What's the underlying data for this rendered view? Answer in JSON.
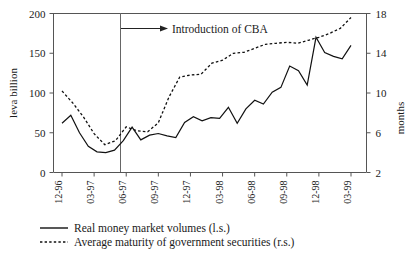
{
  "chart_data": {
    "type": "line",
    "title": "",
    "xlabel": "",
    "ylabel": "leva billion",
    "y2label": "months",
    "categories": [
      "12-96",
      "01-97",
      "02-97",
      "03-97",
      "04-97",
      "05-97",
      "06-97",
      "07-97",
      "08-97",
      "09-97",
      "10-97",
      "11-97",
      "12-97",
      "01-98",
      "02-98",
      "03-98",
      "04-98",
      "05-98",
      "06-98",
      "07-98",
      "08-98",
      "09-98",
      "10-98",
      "11-98",
      "12-98",
      "01-99",
      "02-99",
      "03-99"
    ],
    "tick_labels": [
      "12-96",
      "03-97",
      "06-97",
      "09-97",
      "12-97",
      "03-98",
      "06-98",
      "09-98",
      "12-98",
      "03-99"
    ],
    "ylim": [
      0,
      200
    ],
    "yticks": [
      0,
      50,
      100,
      150,
      200
    ],
    "y2lim": [
      2,
      18
    ],
    "y2ticks": [
      2,
      6,
      10,
      14,
      18
    ],
    "grid": false,
    "legend_position": "bottom-left",
    "series": [
      {
        "name": "Real money market volumes (l.s.)",
        "axis": "left",
        "style": "solid",
        "color": "#111111",
        "values": [
          62,
          70,
          52,
          38,
          30,
          26,
          28,
          26,
          28,
          32,
          36,
          38,
          42,
          40,
          38,
          39,
          38,
          42,
          40,
          38,
          42,
          46,
          43,
          41,
          43,
          47,
          45,
          47
        ]
      },
      {
        "name": "Average maturity of government securities (r.s.)",
        "axis": "right",
        "style": "dotted",
        "color": "#111111",
        "values": [
          10.4,
          9.2,
          8.0,
          6.6,
          5.6,
          5.4,
          6.0,
          7.1,
          8.6,
          10.5,
          11.7,
          11.8,
          12.0,
          12.6,
          13.0,
          13.7,
          14.0,
          14.2,
          14.4,
          14.6,
          14.7,
          14.9,
          15.1,
          15.3,
          15.7,
          16.2,
          16.9,
          17.6
        ]
      }
    ],
    "left_series_detailed": [
      62,
      70,
      52,
      38,
      30,
      26,
      24,
      26,
      28,
      31,
      33,
      34,
      57,
      40,
      47,
      49,
      46,
      44,
      63,
      70,
      65,
      69,
      69,
      82,
      62,
      80,
      91,
      86,
      101,
      107,
      134,
      128,
      110,
      170,
      151,
      146,
      143,
      160
    ],
    "annotation": {
      "text": "Introduction of CBA",
      "marker_tick": "06-97"
    },
    "legend": [
      {
        "label": "Real money market volumes (l.s.)",
        "style": "solid"
      },
      {
        "label": "Average maturity of government securities (r.s.)",
        "style": "dotted"
      }
    ],
    "solid_points": [
      {
        "x": "12-96",
        "y": 62
      },
      {
        "x": "01-97",
        "y": 72
      },
      {
        "x": "02-97",
        "y": 50
      },
      {
        "x": "03-97",
        "y": 33
      },
      {
        "x": "04-97",
        "y": 26
      },
      {
        "x": "05-97",
        "y": 25
      },
      {
        "x": "06-97",
        "y": 28
      },
      {
        "x": "06b-97",
        "y": 40
      },
      {
        "x": "07-97",
        "y": 57
      },
      {
        "x": "08-97",
        "y": 41
      },
      {
        "x": "09-97",
        "y": 47
      },
      {
        "x": "10-97",
        "y": 49
      },
      {
        "x": "11-97",
        "y": 46
      },
      {
        "x": "12-97",
        "y": 44
      },
      {
        "x": "01-98",
        "y": 63
      },
      {
        "x": "02-98",
        "y": 70
      },
      {
        "x": "03-98",
        "y": 65
      },
      {
        "x": "04-98",
        "y": 69
      },
      {
        "x": "05-98",
        "y": 68
      },
      {
        "x": "06-98",
        "y": 82
      },
      {
        "x": "07-98",
        "y": 62
      },
      {
        "x": "08-98",
        "y": 80
      },
      {
        "x": "09-98",
        "y": 91
      },
      {
        "x": "10-98",
        "y": 86
      },
      {
        "x": "11-98",
        "y": 101
      },
      {
        "x": "12-98",
        "y": 107
      },
      {
        "x": "01-99",
        "y": 134
      },
      {
        "x": "02-99",
        "y": 128
      },
      {
        "x": "03-99",
        "y": 110
      },
      {
        "x": "04-99",
        "y": 170
      },
      {
        "x": "05-99",
        "y": 151
      },
      {
        "x": "06-99",
        "y": 146
      },
      {
        "x": "07-99",
        "y": 143
      },
      {
        "x": "08-99",
        "y": 160
      }
    ],
    "dotted_points_months": [
      {
        "x": "12-96",
        "y": 10.2
      },
      {
        "x": "01-97",
        "y": 9.0
      },
      {
        "x": "02-97",
        "y": 7.6
      },
      {
        "x": "03-97",
        "y": 5.9
      },
      {
        "x": "04-97",
        "y": 4.8
      },
      {
        "x": "05-97",
        "y": 5.2
      },
      {
        "x": "06-97",
        "y": 6.6
      },
      {
        "x": "07-97",
        "y": 6.2
      },
      {
        "x": "08-97",
        "y": 6.1
      },
      {
        "x": "09-97",
        "y": 7.0
      },
      {
        "x": "10-97",
        "y": 9.6
      },
      {
        "x": "11-97",
        "y": 11.6
      },
      {
        "x": "12-97",
        "y": 11.8
      },
      {
        "x": "01-98",
        "y": 11.9
      },
      {
        "x": "02-98",
        "y": 13.0
      },
      {
        "x": "03-98",
        "y": 13.3
      },
      {
        "x": "04-98",
        "y": 14.0
      },
      {
        "x": "05-98",
        "y": 14.1
      },
      {
        "x": "06-98",
        "y": 14.5
      },
      {
        "x": "07-98",
        "y": 14.9
      },
      {
        "x": "08-98",
        "y": 15.0
      },
      {
        "x": "09-98",
        "y": 15.1
      },
      {
        "x": "10-98",
        "y": 15.0
      },
      {
        "x": "11-98",
        "y": 15.3
      },
      {
        "x": "12-98",
        "y": 15.6
      },
      {
        "x": "01-99",
        "y": 16.0
      },
      {
        "x": "02-99",
        "y": 16.5
      },
      {
        "x": "03-99",
        "y": 17.6
      }
    ]
  }
}
